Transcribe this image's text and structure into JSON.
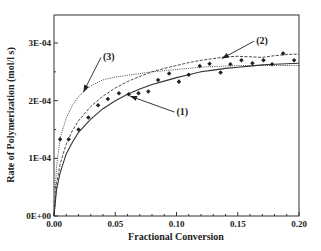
{
  "chart_data": {
    "type": "scatter",
    "title": "",
    "xlabel": "Fractional Conversion",
    "ylabel": "Rate of Polymerization (mol/l s)",
    "xlim": [
      0,
      0.2
    ],
    "ylim": [
      0,
      0.00035
    ],
    "grid": false,
    "legend": "none",
    "x_ticks": [
      0.0,
      0.05,
      0.1,
      0.15,
      0.2
    ],
    "x_tick_labels": [
      "0.00",
      "0.05",
      "0.10",
      "0.15",
      "0.20"
    ],
    "y_ticks": [
      0,
      0.0001,
      0.0002,
      0.0003
    ],
    "y_tick_labels": [
      "0E+00",
      "1E-04",
      "2E-04",
      "3E-04"
    ],
    "series": [
      {
        "name": "experimental",
        "style": "markers",
        "x": [
          0.005,
          0.012,
          0.02,
          0.028,
          0.036,
          0.044,
          0.053,
          0.061,
          0.069,
          0.077,
          0.085,
          0.094,
          0.102,
          0.11,
          0.119,
          0.127,
          0.136,
          0.144,
          0.153,
          0.162,
          0.171,
          0.178,
          0.187,
          0.196
        ],
        "y": [
          0.000133,
          0.000133,
          0.00015,
          0.000171,
          0.000192,
          0.000203,
          0.000213,
          0.000211,
          0.000213,
          0.000216,
          0.000236,
          0.000247,
          0.000233,
          0.000245,
          0.00026,
          0.000264,
          0.000249,
          0.000263,
          0.00027,
          0.000265,
          0.00027,
          0.000263,
          0.000282,
          0.00027
        ]
      },
      {
        "name": "(1)",
        "style": "solid",
        "x": [
          0.0,
          0.002,
          0.005,
          0.01,
          0.015,
          0.02,
          0.03,
          0.04,
          0.05,
          0.06,
          0.07,
          0.08,
          0.09,
          0.1,
          0.11,
          0.12,
          0.13,
          0.14,
          0.15,
          0.16,
          0.17,
          0.18,
          0.19,
          0.2
        ],
        "y": [
          0.0,
          4.5e-05,
          7.5e-05,
          0.000108,
          0.000128,
          0.000145,
          0.000168,
          0.000186,
          0.0002,
          0.000211,
          0.00022,
          0.000228,
          0.000234,
          0.00024,
          0.000245,
          0.00025,
          0.000253,
          0.000256,
          0.000258,
          0.00026,
          0.000262,
          0.000263,
          0.000264,
          0.000265
        ]
      },
      {
        "name": "(2)",
        "style": "dashed",
        "x": [
          0.0,
          0.002,
          0.005,
          0.01,
          0.015,
          0.02,
          0.03,
          0.04,
          0.05,
          0.06,
          0.07,
          0.08,
          0.09,
          0.1,
          0.11,
          0.12,
          0.13,
          0.14,
          0.15,
          0.16,
          0.17,
          0.18,
          0.19,
          0.2
        ],
        "y": [
          0.0,
          5.5e-05,
          9e-05,
          0.000125,
          0.000148,
          0.000165,
          0.00019,
          0.000208,
          0.000222,
          0.000233,
          0.000242,
          0.00025,
          0.000256,
          0.000261,
          0.000266,
          0.00027,
          0.000273,
          0.000276,
          0.000277,
          0.000276,
          0.000275,
          0.000278,
          0.00028,
          0.000281
        ]
      },
      {
        "name": "(3)",
        "style": "dotted",
        "x": [
          0.0,
          0.002,
          0.005,
          0.01,
          0.015,
          0.02,
          0.03,
          0.04,
          0.05,
          0.06,
          0.07,
          0.08,
          0.09,
          0.1,
          0.11,
          0.12,
          0.13,
          0.14,
          0.15,
          0.16,
          0.17,
          0.18,
          0.19,
          0.2
        ],
        "y": [
          0.0,
          8.5e-05,
          0.000135,
          0.00017,
          0.000192,
          0.000207,
          0.000226,
          0.000236,
          0.000241,
          0.000244,
          0.000247,
          0.00025,
          0.000252,
          0.000254,
          0.000256,
          0.000258,
          0.000259,
          0.00026,
          0.000261,
          0.000261,
          0.000261,
          0.000261,
          0.000261,
          0.000261
        ]
      }
    ],
    "annotations": [
      {
        "label": "(1)",
        "text_x": 0.1,
        "text_y": 0.000175,
        "arrow_to_x": 0.062,
        "arrow_to_y": 0.000208
      },
      {
        "label": "(2)",
        "text_x": 0.165,
        "text_y": 0.000298,
        "arrow_to_x": 0.137,
        "arrow_to_y": 0.000273
      },
      {
        "label": "(3)",
        "text_x": 0.04,
        "text_y": 0.00027,
        "arrow_to_x": 0.024,
        "arrow_to_y": 0.000215
      }
    ]
  }
}
